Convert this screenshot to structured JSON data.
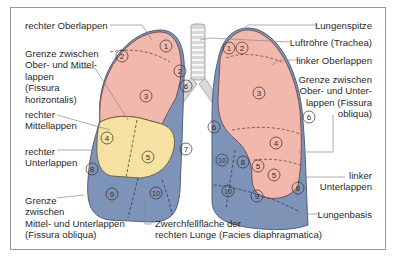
{
  "figure": {
    "colors": {
      "upper_lobe": "#f2b8ad",
      "middle_lobe": "#f5e2a2",
      "lower_lobe": "#7d93b8",
      "lower_lobe_light": "#a3b4cf",
      "trachea": "#d6d6d6",
      "outline": "#5a4a48",
      "frame": "#9a9a9a"
    },
    "labels_left": [
      {
        "id": "rechter-oberlappen",
        "text": "rechter Oberlappen"
      },
      {
        "id": "fissura-horizontalis",
        "text": "Grenze zwischen\nOber- und Mittel-\nlappen\n(Fissura\nhorizontalis)"
      },
      {
        "id": "rechter-mittellappen",
        "text": "rechter\nMittellappen"
      },
      {
        "id": "rechter-unterlappen",
        "text": "rechter\nUnterlappen"
      },
      {
        "id": "fissura-obliqua-rechts",
        "text": "Grenze\nzwischen\nMittel- und Unterlappen\n(Fissura obliqua)"
      }
    ],
    "labels_right": [
      {
        "id": "lungenspitze",
        "text": "Lungenspitze"
      },
      {
        "id": "trachea",
        "text": "Luftröhre (Trachea)"
      },
      {
        "id": "linker-oberlappen",
        "text": "linker Oberlappen"
      },
      {
        "id": "fissura-obliqua-links",
        "text": "Grenze zwischen\nOber- und Unter-\nlappen (Fissura\nobliqua)"
      },
      {
        "id": "linker-unterlappen",
        "text": "linker\nUnterlappen"
      },
      {
        "id": "lungenbasis",
        "text": "Lungenbasis"
      }
    ],
    "labels_bottom": [
      {
        "id": "zwerchfellflaeche",
        "text": "Zwerchfellfläche der\nrechten Lunge (Facies diaphragmatica)"
      }
    ],
    "segments_right_lung": [
      "1",
      "2",
      "2",
      "3",
      "4",
      "5",
      "6",
      "7",
      "8",
      "9",
      "10"
    ],
    "segments_left_lung": [
      "1",
      "2",
      "3",
      "4",
      "5",
      "5",
      "6",
      "6",
      "8",
      "8",
      "9",
      "10",
      "10"
    ]
  }
}
